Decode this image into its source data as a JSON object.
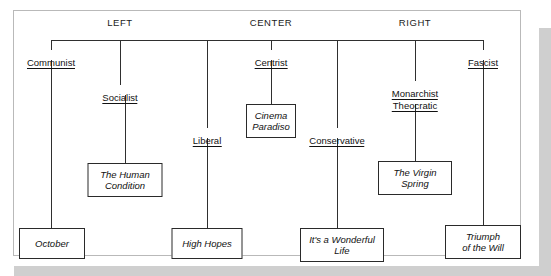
{
  "figure": {
    "type": "political-spectrum-tree",
    "headers": [
      {
        "label": "LEFT",
        "x": 120
      },
      {
        "label": "CENTER",
        "x": 271
      },
      {
        "label": "RIGHT",
        "x": 415
      }
    ],
    "bus": {
      "x_start": 51,
      "x_end": 483,
      "y": 40
    },
    "nodes": [
      {
        "id": "communist",
        "label": "Communist",
        "x": 51,
        "y": 57
      },
      {
        "id": "socialist",
        "label": "Socialist",
        "x": 120,
        "y": 92
      },
      {
        "id": "liberal",
        "label": "Liberal",
        "x": 207,
        "y": 135
      },
      {
        "id": "centrist",
        "label": "Centrist",
        "x": 271,
        "y": 57
      },
      {
        "id": "conservative",
        "label": "Conservative",
        "x": 337,
        "y": 135
      },
      {
        "id": "monarchist",
        "label": "Monarchist",
        "line2": "Theocratic",
        "x": 415,
        "y": 88
      },
      {
        "id": "fascist",
        "label": "Fascist",
        "x": 483,
        "y": 57
      }
    ],
    "films": [
      {
        "id": "october",
        "title": "October",
        "lines": [
          "October"
        ],
        "x": 52,
        "y": 228,
        "w": 66,
        "h": 31,
        "parent": "communist"
      },
      {
        "id": "the-human-condition",
        "title": "The Human Condition",
        "lines": [
          "The Human",
          "Condition"
        ],
        "x": 125,
        "y": 163,
        "w": 75,
        "h": 34,
        "parent": "socialist"
      },
      {
        "id": "high-hopes",
        "title": "High Hopes",
        "lines": [
          "High Hopes"
        ],
        "x": 207,
        "y": 228,
        "w": 71,
        "h": 31,
        "parent": "liberal"
      },
      {
        "id": "cinema-paradiso",
        "title": "Cinema Paradiso",
        "lines": [
          "Cinema",
          "Paradiso"
        ],
        "x": 271,
        "y": 104,
        "w": 50,
        "h": 34,
        "parent": "centrist"
      },
      {
        "id": "its-a-wonderful-life",
        "title": "It's a Wonderful Life",
        "lines": [
          "It's a Wonderful",
          "Life"
        ],
        "x": 342,
        "y": 228,
        "w": 84,
        "h": 34,
        "parent": "conservative"
      },
      {
        "id": "the-virgin-spring",
        "title": "The Virgin Spring",
        "lines": [
          "The Virgin",
          "Spring"
        ],
        "x": 415,
        "y": 161,
        "w": 74,
        "h": 34,
        "parent": "monarchist"
      },
      {
        "id": "triumph-of-the-will",
        "title": "Triumph of the Will",
        "lines": [
          "Triumph",
          "of the Will"
        ],
        "x": 483,
        "y": 225,
        "w": 76,
        "h": 34,
        "parent": "fascist"
      }
    ],
    "connectors": [
      {
        "from": "bus",
        "to": "communist",
        "x": 51,
        "y1": 40,
        "y2": 50
      },
      {
        "from": "bus",
        "to": "socialist",
        "x": 120,
        "y1": 40,
        "y2": 85
      },
      {
        "from": "bus",
        "to": "liberal",
        "x": 207,
        "y1": 40,
        "y2": 128
      },
      {
        "from": "bus",
        "to": "centrist",
        "x": 271,
        "y1": 40,
        "y2": 50
      },
      {
        "from": "bus",
        "to": "conservative",
        "x": 337,
        "y1": 40,
        "y2": 128
      },
      {
        "from": "bus",
        "to": "monarchist",
        "x": 415,
        "y1": 40,
        "y2": 81
      },
      {
        "from": "bus",
        "to": "fascist",
        "x": 483,
        "y1": 40,
        "y2": 50
      },
      {
        "from": "communist",
        "to": "october",
        "x": 51,
        "y1": 60,
        "y2": 228
      },
      {
        "from": "socialist",
        "to": "the-human-condition",
        "x": 125,
        "y1": 95,
        "y2": 163
      },
      {
        "from": "liberal",
        "to": "high-hopes",
        "x": 207,
        "y1": 138,
        "y2": 228
      },
      {
        "from": "centrist",
        "to": "cinema-paradiso",
        "x": 271,
        "y1": 60,
        "y2": 104
      },
      {
        "from": "conservative",
        "to": "its-a-wonderful-life",
        "x": 337,
        "y1": 138,
        "y2": 228
      },
      {
        "from": "monarchist",
        "to": "the-virgin-spring",
        "x": 415,
        "y1": 104,
        "y2": 161
      },
      {
        "from": "fascist",
        "to": "triumph-of-the-will",
        "x": 483,
        "y1": 60,
        "y2": 225
      }
    ],
    "colors": {
      "line": "#2f2f2f",
      "text": "#111111",
      "page": "#ffffff",
      "shadow": "#cfcfcf",
      "frame": "#b9b9b9"
    }
  }
}
